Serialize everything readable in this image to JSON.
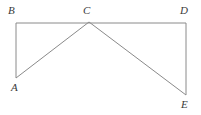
{
  "figure": {
    "kind": "geometry-line-diagram",
    "background_color": "#ffffff",
    "stroke_color": "#8a8a8a",
    "label_color": "#3a3a3a",
    "stroke_width": 1,
    "canvas": {
      "width": 201,
      "height": 115
    },
    "points": [
      {
        "id": "A",
        "label": "A",
        "x": 16,
        "y": 78
      },
      {
        "id": "B",
        "label": "B",
        "x": 16,
        "y": 23
      },
      {
        "id": "C",
        "label": "C",
        "x": 89,
        "y": 22
      },
      {
        "id": "D",
        "label": "D",
        "x": 186,
        "y": 23
      },
      {
        "id": "E",
        "label": "E",
        "x": 186,
        "y": 95
      }
    ],
    "segments": [
      {
        "id": "BD",
        "from": "B",
        "to": "D",
        "x1": 16,
        "y1": 23,
        "x2": 186,
        "y2": 23
      },
      {
        "id": "BA",
        "from": "B",
        "to": "A",
        "x1": 16,
        "y1": 23,
        "x2": 16,
        "y2": 78
      },
      {
        "id": "DE",
        "from": "D",
        "to": "E",
        "x1": 186,
        "y1": 23,
        "x2": 186,
        "y2": 95
      },
      {
        "id": "AC",
        "from": "A",
        "to": "C",
        "x1": 16,
        "y1": 78,
        "x2": 89,
        "y2": 22
      },
      {
        "id": "CE",
        "from": "C",
        "to": "E",
        "x1": 89,
        "y1": 22,
        "x2": 186,
        "y2": 95
      }
    ],
    "labels": [
      {
        "id": "A",
        "text": "A",
        "left": 11,
        "top": 82
      },
      {
        "id": "B",
        "text": "B",
        "left": 8,
        "top": 5
      },
      {
        "id": "C",
        "text": "C",
        "left": 83,
        "top": 5
      },
      {
        "id": "D",
        "text": "D",
        "left": 180,
        "top": 5
      },
      {
        "id": "E",
        "text": "E",
        "left": 181,
        "top": 99
      }
    ]
  }
}
